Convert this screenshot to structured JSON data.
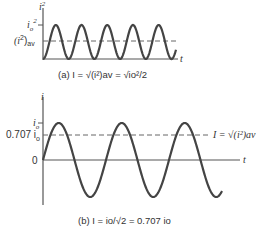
{
  "panel_a": {
    "y_axis_label": "i",
    "y_axis_sup": "2",
    "tick_peak_main": "i",
    "tick_peak_sub": "o",
    "tick_peak_sup": "2",
    "tick_avg_main": "(i",
    "tick_avg_sup": "2",
    "tick_avg_close": ")",
    "tick_avg_sub": "av",
    "x_axis_label": "t",
    "caption": "(a) I = √(i²)av = √io²/2"
  },
  "panel_b": {
    "y_axis_label": "i",
    "tick_peak_main": "i",
    "tick_peak_sub": "o",
    "tick_rms_main": "0.707 i",
    "tick_rms_sub": "o",
    "tick_zero": "0",
    "x_axis_label": "t",
    "rms_annotation": "I = √(i²)av",
    "caption": "(b) I = io/√2 = 0.707 io"
  },
  "colors": {
    "curve": "#444444",
    "axis": "#555555",
    "dashed": "#666666"
  }
}
